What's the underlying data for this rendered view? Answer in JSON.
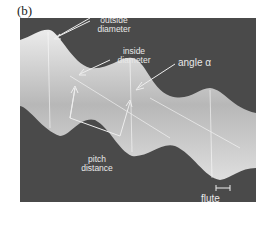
{
  "figure": {
    "panel_label": "(b)",
    "annotations": {
      "outside_diameter": [
        "outside",
        "diameter"
      ],
      "inside_diameter": [
        "inside",
        "diameter"
      ],
      "angle": "angle α",
      "pitch_distance": [
        "pitch",
        "distance"
      ],
      "flute_width": [
        "flute",
        "width"
      ]
    },
    "colors": {
      "background": "#4a4a4a",
      "drill": "#d8d8d8",
      "annotation": "#e8e8e8"
    }
  }
}
